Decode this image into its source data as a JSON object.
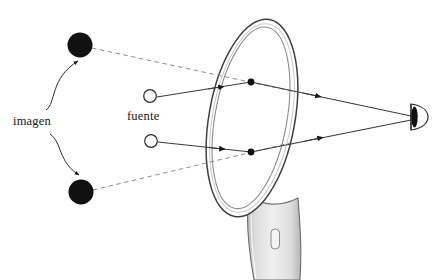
{
  "figure": {
    "type": "optics-ray-diagram",
    "title_visible": false,
    "background_color": "#ffffff",
    "width": 448,
    "height": 280
  },
  "labels": {
    "imagen": "imagen",
    "fuente": "fuente"
  },
  "colors": {
    "ink": "#1a1a1a",
    "ray": "#3c3c3c",
    "virtual_ray": "#7a7a7a",
    "mirror_outline": "#4a4a4a",
    "mirror_rim": "#9a9a9a",
    "handle_fill": "#e8e8e8",
    "handle_edge": "#6f6f6f",
    "image_dot_fill": "#111111",
    "source_fill": "#ffffff"
  },
  "objects": {
    "mirror": {
      "name": "hand-mirror",
      "center": [
        252,
        118
      ],
      "rx": 43,
      "ry": 100,
      "rotation_deg": 10,
      "rim_inset": 6
    },
    "handle": {
      "name": "mirror-handle",
      "hole": [
        275,
        238
      ]
    },
    "eye": {
      "name": "observer-eye",
      "position": [
        417,
        117
      ]
    },
    "images": [
      {
        "name": "virtual-image-upper",
        "position": [
          80,
          45
        ],
        "radius": 12.5,
        "filled": true
      },
      {
        "name": "virtual-image-lower",
        "position": [
          81,
          192
        ],
        "radius": 12.5,
        "filled": true
      }
    ],
    "sources": [
      {
        "name": "light-source-upper",
        "position": [
          150,
          96
        ],
        "radius": 6.5,
        "filled": false
      },
      {
        "name": "light-source-lower",
        "position": [
          151,
          141
        ],
        "radius": 6.5,
        "filled": false
      }
    ],
    "reflection_points": [
      {
        "name": "reflection-point-upper",
        "position": [
          251,
          82
        ]
      },
      {
        "name": "reflection-point-lower",
        "position": [
          251,
          152
        ]
      }
    ]
  },
  "rays": [
    {
      "name": "incident-ray-upper",
      "style": "solid",
      "from": [
        157,
        97
      ],
      "to": [
        251,
        82
      ],
      "arrow_at": [
        221,
        87
      ]
    },
    {
      "name": "reflected-ray-upper",
      "style": "solid",
      "from": [
        251,
        82
      ],
      "to": [
        411,
        116
      ],
      "arrow_at": [
        318,
        96
      ]
    },
    {
      "name": "virtual-extension-upper",
      "style": "dashed",
      "from": [
        92,
        48
      ],
      "to": [
        251,
        82
      ]
    },
    {
      "name": "incident-ray-lower",
      "style": "solid",
      "from": [
        158,
        142
      ],
      "to": [
        251,
        152
      ],
      "arrow_at": [
        222,
        152
      ]
    },
    {
      "name": "reflected-ray-lower",
      "style": "solid",
      "from": [
        251,
        152
      ],
      "to": [
        411,
        120
      ],
      "arrow_at": [
        320,
        138
      ]
    },
    {
      "name": "virtual-extension-lower",
      "style": "dashed",
      "from": [
        93,
        190
      ],
      "to": [
        251,
        152
      ]
    }
  ],
  "callouts": [
    {
      "name": "callout-arrow-to-upper-image",
      "from": [
        42,
        110
      ],
      "to": [
        78,
        59
      ]
    },
    {
      "name": "callout-arrow-to-lower-image",
      "from": [
        48,
        134
      ],
      "to": [
        80,
        177
      ]
    }
  ]
}
